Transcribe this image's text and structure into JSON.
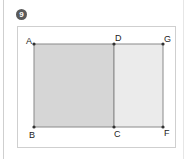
{
  "badge": {
    "label": "9"
  },
  "colors": {
    "rect_left_fill": "#d6d6d6",
    "rect_right_fill": "#ebebeb",
    "edge": "#8a8a8a",
    "point": "#333333"
  },
  "points": {
    "A": {
      "label": "A"
    },
    "D": {
      "label": "D"
    },
    "G": {
      "label": "G"
    },
    "B": {
      "label": "B"
    },
    "C": {
      "label": "C"
    },
    "F": {
      "label": "F"
    }
  },
  "shapes": [
    {
      "name": "rectangle ABCD",
      "vertices": [
        "A",
        "B",
        "C",
        "D"
      ],
      "shade": "dark"
    },
    {
      "name": "rectangle DCFG",
      "vertices": [
        "D",
        "C",
        "F",
        "G"
      ],
      "shade": "light"
    }
  ]
}
